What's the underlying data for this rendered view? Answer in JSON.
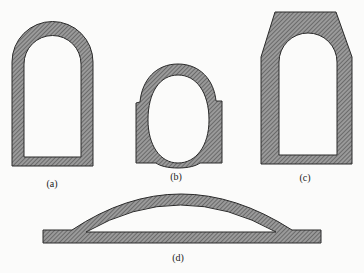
{
  "figure": {
    "panels": [
      {
        "id": "a",
        "label": "(a)",
        "shape": "straight-wall semicircular-arch tunnel lining (horseshoe, flat invert)"
      },
      {
        "id": "b",
        "label": "(b)",
        "shape": "oval (elliptical) lining within rectangular block with arched crown"
      },
      {
        "id": "c",
        "label": "(c)",
        "shape": "arched opening within chamfered polygonal thick-wall section"
      },
      {
        "id": "d",
        "label": "(d)",
        "shape": "shallow arch (dome) over flat slab"
      }
    ],
    "colors": {
      "fill": "#8a8a8a",
      "hatch": "#444444",
      "outline": "#2a2a2a",
      "background": "#fbfbfa"
    }
  }
}
